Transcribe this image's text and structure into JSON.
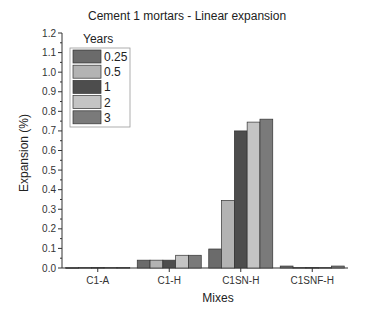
{
  "chart_data": {
    "type": "bar",
    "title": "Cement 1 mortars - Linear expansion",
    "xlabel": "Mixes",
    "ylabel": "Expansion (%)",
    "ylim": [
      0,
      1.2
    ],
    "yticks": [
      "0.0",
      "0.1",
      "0.2",
      "0.3",
      "0.4",
      "0.5",
      "0.6",
      "0.7",
      "0.8",
      "0.9",
      "1.0",
      "1.1",
      "1.2"
    ],
    "categories": [
      "C1-A",
      "C1-H",
      "C1SN-H",
      "C1SNF-H"
    ],
    "legend_title": "Years",
    "legend_position": "upper-left",
    "grid": false,
    "series": [
      {
        "name": "0.25",
        "color": "#6b6b6b",
        "values": [
          0.002,
          0.04,
          0.097,
          0.01
        ]
      },
      {
        "name": "0.5",
        "color": "#b3b3b3",
        "values": [
          0.003,
          0.04,
          0.345,
          0.003
        ]
      },
      {
        "name": "1",
        "color": "#4d4d4d",
        "values": [
          0.003,
          0.04,
          0.7,
          0.003
        ]
      },
      {
        "name": "2",
        "color": "#c4c4c4",
        "values": [
          0.003,
          0.065,
          0.745,
          0.003
        ]
      },
      {
        "name": "3",
        "color": "#7a7a7a",
        "values": [
          0.003,
          0.065,
          0.76,
          0.01
        ]
      }
    ]
  }
}
